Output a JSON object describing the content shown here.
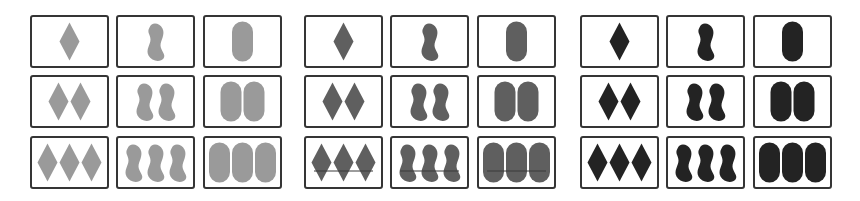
{
  "diagram": {
    "panels": [
      {
        "id": "light",
        "fill": "#9a9a9a",
        "left": 30,
        "strike": false
      },
      {
        "id": "medium",
        "fill": "#5f5f5f",
        "left": 304,
        "strike": true,
        "strike_color": "#3a3a3a"
      },
      {
        "id": "dark",
        "fill": "#232323",
        "left": 580,
        "strike": false
      }
    ],
    "columns": [
      "diamond",
      "squiggle",
      "oval"
    ],
    "rows": [
      1,
      2,
      3
    ],
    "card_border_color": "#353535"
  }
}
